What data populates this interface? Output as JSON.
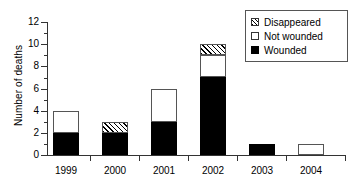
{
  "chart_data": {
    "type": "bar",
    "subtype": "stacked",
    "title": "",
    "subtitle": "",
    "xlabel": "",
    "ylabel": "Number of deaths",
    "categories": [
      "1999",
      "2000",
      "2001",
      "2002",
      "2003",
      "2004"
    ],
    "series": [
      {
        "name": "Wounded",
        "values": [
          2,
          2,
          3,
          7,
          1,
          0
        ]
      },
      {
        "name": "Not wounded",
        "values": [
          2,
          0,
          3,
          2,
          0,
          1
        ]
      },
      {
        "name": "Disappeared",
        "values": [
          0,
          1,
          0,
          1,
          0,
          0
        ]
      }
    ],
    "totals": [
      4,
      3,
      6,
      10,
      1,
      1
    ],
    "ylim": [
      0,
      12
    ],
    "ytick_labels": [
      "0",
      "2",
      "4",
      "6",
      "8",
      "10",
      "12"
    ],
    "ytick_values": [
      0,
      2,
      4,
      6,
      8,
      10,
      12
    ],
    "yminor_tick_values": [
      1,
      3,
      5,
      7,
      9,
      11
    ],
    "grid": false,
    "legend_position": "top-right",
    "legend_entries": [
      {
        "label": "Disappeared",
        "swatch": "hatched"
      },
      {
        "label": "Not wounded",
        "swatch": "empty"
      },
      {
        "label": "Wounded",
        "swatch": "filled"
      }
    ],
    "colors": {
      "wounded": "#000000",
      "not_wounded": "#ffffff",
      "disappeared_hatch": "#000000",
      "axis": "#333333",
      "background": "#ffffff"
    }
  }
}
